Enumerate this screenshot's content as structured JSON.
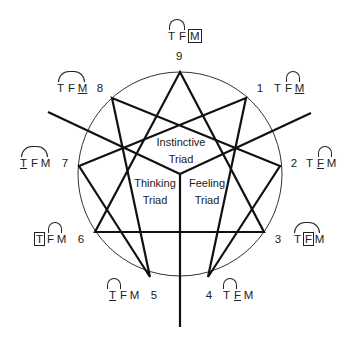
{
  "diagram": {
    "circle": {
      "cx": 180,
      "cy": 174,
      "r": 102
    },
    "points": [
      {
        "n": "9",
        "x": 180,
        "y": 72
      },
      {
        "n": "1",
        "x": 246,
        "y": 98
      },
      {
        "n": "2",
        "x": 280,
        "y": 166
      },
      {
        "n": "3",
        "x": 264,
        "y": 232
      },
      {
        "n": "4",
        "x": 208,
        "y": 277
      },
      {
        "n": "5",
        "x": 150,
        "y": 277
      },
      {
        "n": "6",
        "x": 95,
        "y": 232
      },
      {
        "n": "7",
        "x": 79,
        "y": 166
      },
      {
        "n": "8",
        "x": 112,
        "y": 98
      }
    ],
    "triads": {
      "instinctive": [
        "Instinctive",
        "Triad"
      ],
      "thinking": [
        "Thinking",
        "Triad"
      ],
      "feeling": [
        "Feeling",
        "Triad"
      ]
    },
    "letters": [
      "T",
      "F",
      "M"
    ],
    "types": [
      {
        "number": "9",
        "dominant": "M",
        "style": "box",
        "arc": "F-M"
      },
      {
        "number": "1",
        "dominant": "M",
        "style": "underline",
        "arc": "F-M"
      },
      {
        "number": "2",
        "dominant": "F",
        "style": "underline",
        "arc": "F-M"
      },
      {
        "number": "3",
        "dominant": "F",
        "style": "box",
        "arc": "T-M"
      },
      {
        "number": "4",
        "dominant": "F",
        "style": "underline",
        "arc": "T-F"
      },
      {
        "number": "5",
        "dominant": "T",
        "style": "underline",
        "arc": "T-F"
      },
      {
        "number": "6",
        "dominant": "T",
        "style": "box",
        "arc": "F-M"
      },
      {
        "number": "7",
        "dominant": "T",
        "style": "underline",
        "arc": "T-M"
      },
      {
        "number": "8",
        "dominant": "M",
        "style": "underline",
        "arc": "T-M"
      }
    ]
  }
}
